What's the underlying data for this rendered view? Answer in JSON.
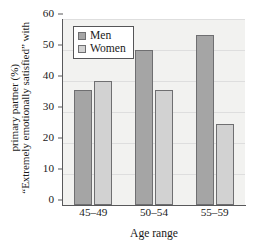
{
  "chart_data": {
    "type": "bar",
    "title": "",
    "categories": [
      "45–49",
      "50–54",
      "55–59"
    ],
    "series": [
      {
        "name": "Men",
        "values": [
          37,
          50,
          55
        ],
        "color": "#a5a5a5"
      },
      {
        "name": "Women",
        "values": [
          40,
          37,
          26
        ],
        "color": "#d2d2d2"
      }
    ],
    "xlabel": "Age range",
    "ylabel_line1": "“Extremely emotionally satisfied” with",
    "ylabel_line2": "primary partner (%)",
    "ylim": [
      0,
      60
    ],
    "ytick_values": [
      0,
      10,
      20,
      30,
      40,
      50,
      60
    ],
    "ytick_labels": [
      "0",
      "10",
      "20",
      "30",
      "40",
      "50",
      "60"
    ],
    "grid": true,
    "legend_position": "upper-left-inside",
    "plot_background": "#f2f2f0",
    "axis_color": "#58585a",
    "grid_color": "#dedede"
  },
  "legend": {
    "entries": [
      {
        "label": "Men"
      },
      {
        "label": "Women"
      }
    ]
  }
}
